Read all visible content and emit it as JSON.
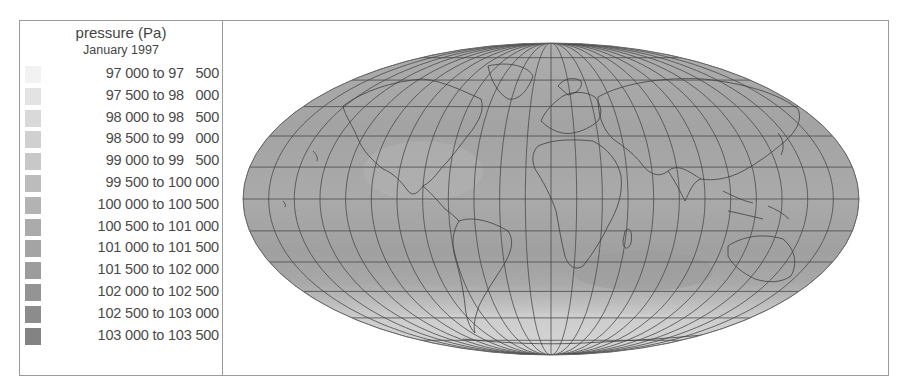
{
  "legend": {
    "title": "pressure (Pa)",
    "subtitle": "January 1997",
    "items": [
      {
        "label": "97 000 to 97   500",
        "color": "#f2f2f2"
      },
      {
        "label": "97 500 to 98   000",
        "color": "#e3e3e3"
      },
      {
        "label": "98 000 to 98   500",
        "color": "#d9d9d9"
      },
      {
        "label": "98 500 to 99   000",
        "color": "#d0d0d0"
      },
      {
        "label": "99 000 to 99   500",
        "color": "#c8c8c8"
      },
      {
        "label": "99 500 to 100 000",
        "color": "#bcbcbc"
      },
      {
        "label": "100 000 to 100 500",
        "color": "#b3b3b3"
      },
      {
        "label": "100 500 to 101 000",
        "color": "#ababab"
      },
      {
        "label": "101 000 to 101 500",
        "color": "#a4a4a4"
      },
      {
        "label": "101 500 to 102 000",
        "color": "#9c9c9c"
      },
      {
        "label": "102 000 to 102 500",
        "color": "#949494"
      },
      {
        "label": "102 500 to 103 000",
        "color": "#8c8c8c"
      },
      {
        "label": "103 000 to 103 500",
        "color": "#838383"
      }
    ]
  },
  "map": {
    "projection": "Mollweide",
    "variable": "surface pressure",
    "graticule": "15° meridians, 15° parallels",
    "ocean_fill": "#a9a9a9",
    "polar_fill": "#d6d6d6",
    "coastline_color": "#555555"
  }
}
